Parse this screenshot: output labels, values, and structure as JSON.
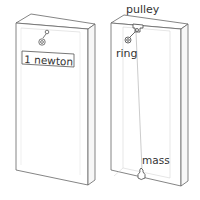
{
  "diagram": {
    "left_box": {
      "label": "1 newton"
    },
    "right_box": {
      "labels": {
        "pulley": "pulley",
        "ring": "ring",
        "mass": "mass"
      }
    }
  },
  "colors": {
    "line": "#555555",
    "faint_line": "#bbbbbb",
    "text": "#333333",
    "background": "#ffffff"
  }
}
